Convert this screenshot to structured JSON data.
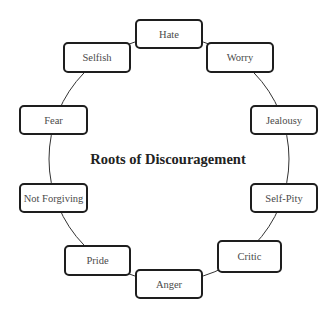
{
  "diagram": {
    "title": "Roots of Discouragement",
    "type": "cycle",
    "nodes": [
      {
        "label": "Hate",
        "x": 135,
        "y": 19,
        "w": 68,
        "h": 30
      },
      {
        "label": "Worry",
        "x": 206,
        "y": 42,
        "w": 68,
        "h": 31
      },
      {
        "label": "Jealousy",
        "x": 250,
        "y": 105,
        "w": 68,
        "h": 30
      },
      {
        "label": "Self-Pity",
        "x": 250,
        "y": 183,
        "w": 68,
        "h": 30
      },
      {
        "label": "Critic",
        "x": 217,
        "y": 240,
        "w": 65,
        "h": 33
      },
      {
        "label": "Anger",
        "x": 135,
        "y": 269,
        "w": 68,
        "h": 30
      },
      {
        "label": "Pride",
        "x": 64,
        "y": 245,
        "w": 67,
        "h": 31
      },
      {
        "label": "Not Forgiving",
        "x": 19,
        "y": 183,
        "w": 69,
        "h": 30
      },
      {
        "label": "Fear",
        "x": 19,
        "y": 105,
        "w": 69,
        "h": 30
      },
      {
        "label": "Selfish",
        "x": 63,
        "y": 42,
        "w": 68,
        "h": 31
      }
    ],
    "colors": {
      "border": "#1e1e1e",
      "text": "#4a4a4a",
      "ring": "#333333"
    }
  }
}
